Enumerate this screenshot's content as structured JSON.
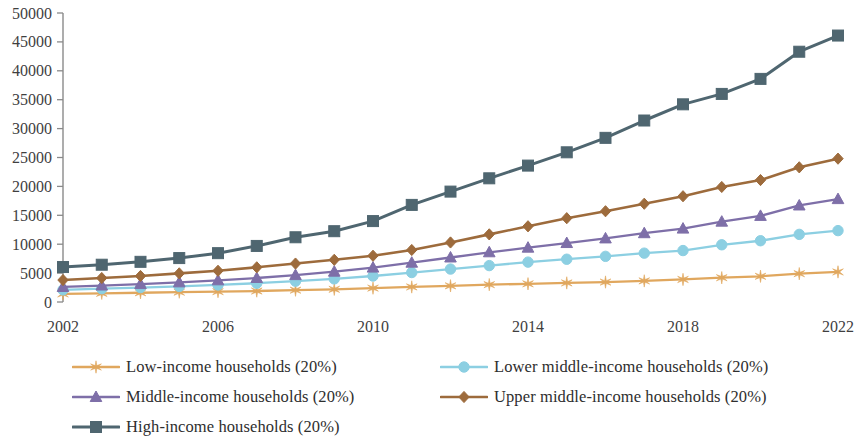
{
  "chart_data": {
    "type": "line",
    "title": "",
    "subtitle": "",
    "xlabel": "",
    "ylabel": "",
    "x": [
      2002,
      2003,
      2004,
      2005,
      2006,
      2007,
      2008,
      2009,
      2010,
      2011,
      2012,
      2013,
      2014,
      2015,
      2016,
      2017,
      2018,
      2019,
      2020,
      2021,
      2022
    ],
    "xlim": [
      2002,
      2022
    ],
    "ylim": [
      0,
      50000
    ],
    "ytick_labels": [
      "0",
      "5000",
      "10000",
      "15000",
      "20000",
      "25000",
      "30000",
      "35000",
      "40000",
      "45000",
      "50000"
    ],
    "yticks": [
      0,
      5000,
      10000,
      15000,
      20000,
      25000,
      30000,
      35000,
      40000,
      45000,
      50000
    ],
    "xtick_labels": [
      "2002",
      "2006",
      "2010",
      "2014",
      "2018",
      "2022"
    ],
    "xticks": [
      2002,
      2006,
      2010,
      2014,
      2018,
      2022
    ],
    "grid": false,
    "legend_position": "bottom",
    "series": [
      {
        "name": "Low-income households (20%)",
        "color": "#E0A75E",
        "marker": "star",
        "values": [
          1400,
          1500,
          1600,
          1700,
          1800,
          1900,
          2050,
          2200,
          2400,
          2600,
          2800,
          3000,
          3150,
          3300,
          3450,
          3650,
          3900,
          4200,
          4450,
          4900,
          5200
        ]
      },
      {
        "name": "Lower middle-income households (20%)",
        "color": "#8CCFE2",
        "marker": "circle",
        "values": [
          2100,
          2300,
          2500,
          2700,
          2950,
          3250,
          3600,
          4000,
          4500,
          5100,
          5700,
          6300,
          6900,
          7400,
          7900,
          8450,
          8900,
          9900,
          10600,
          11700,
          12350
        ]
      },
      {
        "name": "Middle-income households (20%)",
        "color": "#7E6FA8",
        "marker": "triangle",
        "values": [
          2600,
          2850,
          3100,
          3400,
          3750,
          4150,
          4650,
          5250,
          5950,
          6800,
          7700,
          8600,
          9400,
          10200,
          11000,
          11900,
          12700,
          13900,
          14900,
          16700,
          17800
        ]
      },
      {
        "name": "Upper middle-income households (20%)",
        "color": "#9D6B3C",
        "marker": "diamond",
        "values": [
          3800,
          4150,
          4500,
          4950,
          5400,
          6000,
          6650,
          7300,
          8000,
          9000,
          10300,
          11700,
          13100,
          14500,
          15700,
          17000,
          18300,
          19900,
          21100,
          23300,
          24800
        ]
      },
      {
        "name": "High-income households (20%)",
        "color": "#4F6670",
        "marker": "square",
        "values": [
          6050,
          6450,
          6950,
          7600,
          8450,
          9700,
          11200,
          12250,
          14000,
          16800,
          19100,
          21400,
          23600,
          25900,
          28400,
          31400,
          34200,
          36000,
          38600,
          43300,
          46100
        ]
      }
    ]
  },
  "legend": {
    "items": [
      {
        "label": "Low-income households (20%)"
      },
      {
        "label": "Lower middle-income households (20%)"
      },
      {
        "label": "Middle-income households (20%)"
      },
      {
        "label": "Upper middle-income households (20%)"
      },
      {
        "label": "High-income households (20%)"
      }
    ]
  }
}
